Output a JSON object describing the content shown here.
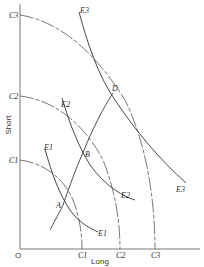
{
  "diagram": {
    "axes": {
      "origin_label": "O",
      "x_label": "Long",
      "y_label": "Short"
    },
    "c_curves": [
      {
        "name": "C1",
        "y_intercept_label": "C1",
        "x_intercept_label": "C1"
      },
      {
        "name": "C2",
        "y_intercept_label": "C2",
        "x_intercept_label": "C2"
      },
      {
        "name": "C3",
        "y_intercept_label": "C3",
        "x_intercept_label": "C3"
      }
    ],
    "e_curves": [
      {
        "name": "E1",
        "top_label": "E1",
        "bottom_label": "E1"
      },
      {
        "name": "E2",
        "top_label": "E2",
        "bottom_label": "E2"
      },
      {
        "name": "E3",
        "top_label": "E3",
        "bottom_label": "E3"
      }
    ],
    "points": [
      {
        "label": "A"
      },
      {
        "label": "B"
      },
      {
        "label": "D"
      }
    ]
  }
}
